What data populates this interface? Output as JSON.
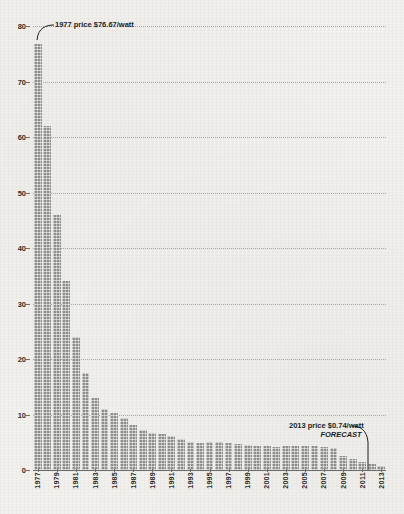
{
  "chart_data": {
    "type": "bar",
    "title": "",
    "subtitle": "",
    "xlabel": "",
    "ylabel": "",
    "ylim": [
      0,
      80
    ],
    "ytick_values": [
      0,
      10,
      20,
      30,
      40,
      50,
      60,
      70,
      80
    ],
    "ytick_labels": [
      "0",
      "10",
      "20",
      "30",
      "40",
      "50",
      "60",
      "70",
      "80"
    ],
    "grid": true,
    "legend": "none",
    "categories": [
      "1977",
      "1978",
      "1979",
      "1980",
      "1981",
      "1982",
      "1983",
      "1984",
      "1985",
      "1986",
      "1987",
      "1988",
      "1989",
      "1990",
      "1991",
      "1992",
      "1993",
      "1994",
      "1995",
      "1996",
      "1997",
      "1998",
      "1999",
      "2000",
      "2001",
      "2002",
      "2003",
      "2004",
      "2005",
      "2006",
      "2007",
      "2008",
      "2009",
      "2010",
      "2011",
      "2012",
      "2013"
    ],
    "xtick_labels": [
      "1977",
      "1979",
      "1981",
      "1983",
      "1985",
      "1987",
      "1989",
      "1991",
      "1993",
      "1995",
      "1997",
      "1999",
      "2001",
      "2003",
      "2005",
      "2007",
      "2009",
      "2011",
      "2013"
    ],
    "values": [
      76.67,
      62.0,
      46.0,
      34.0,
      24.0,
      17.5,
      13.0,
      11.0,
      10.2,
      9.4,
      8.2,
      7.3,
      6.7,
      6.4,
      6.2,
      5.6,
      5.0,
      4.8,
      5.1,
      5.0,
      4.8,
      4.6,
      4.5,
      4.4,
      4.3,
      4.1,
      4.3,
      4.4,
      4.3,
      4.3,
      4.2,
      4.0,
      2.6,
      1.9,
      1.5,
      1.0,
      0.74
    ],
    "annotations": [
      {
        "id": "first",
        "label": "1977 price $76.67/watt",
        "target_category": "1977",
        "target_value": 76.67
      },
      {
        "id": "last",
        "label": "2013 price $0.74/watt",
        "sublabel": "FORECAST",
        "target_category": "2013",
        "target_value": 0.74
      }
    ],
    "colors": {
      "background": "#f2f1ed",
      "bar": "#8e8e8a",
      "grid": "#9a9a96",
      "axis": "#6d6d69",
      "text": "#1f1f1d"
    }
  }
}
